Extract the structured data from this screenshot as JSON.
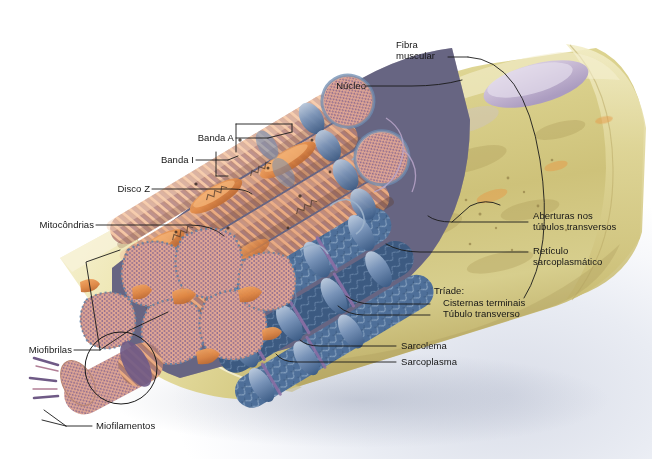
{
  "figure": {
    "language": "pt-BR",
    "background_color": "#ffffff"
  },
  "labels": {
    "fibra_muscular": "Fibra\nmuscular",
    "nucleo": "Núcleo",
    "banda_a": "Banda A",
    "banda_i": "Banda I",
    "disco_z": "Disco Z",
    "mitocondrias": "Mitocôndrias",
    "miofibrilas": "Miofibrilas",
    "miofilamentos": "Miofilamentos",
    "aberturas": "Aberturas nos\ntúbulos transversos",
    "reticulo": "Retículo\nsarcoplasmático",
    "triade": "Tríade:",
    "cisternas_terminais": "Cisternas terminais",
    "tubulo_transverso": "Túbulo transverso",
    "sarcolema": "Sarcolema",
    "sarcoplasma": "Sarcoplasma"
  },
  "colors": {
    "sarcolemma_yellow": "#d8cf8a",
    "sarcolemma_light": "#efe8b6",
    "sarcoplasm_tan": "#c9bd77",
    "myofibril_salmon": "#d98f6a",
    "myofibril_light": "#e8b294",
    "a_band_purple": "#7d6a95",
    "i_band_pink": "#e3a083",
    "sr_blue": "#5b7fa8",
    "sr_deep_blue": "#3d5f85",
    "cross_section_pink": "#e0a593",
    "myofilament_dot": "#7b5f8e",
    "mitochondria_orange": "#e08a4d",
    "nucleus_purple": "#c9bcd4",
    "leader_line": "#1a1a1a",
    "text": "#161616"
  },
  "leader_lines": {
    "count": 15,
    "stroke": "#1a1a1a",
    "stroke_width": 0.9
  }
}
